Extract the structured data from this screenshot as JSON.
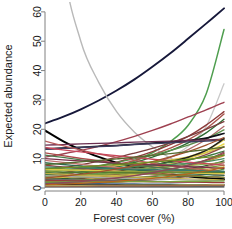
{
  "chart_data": {
    "type": "line",
    "title": "",
    "xlabel": "Forest cover (%)",
    "ylabel": "Expected abundance",
    "xlim": [
      0,
      100
    ],
    "ylim": [
      0,
      62
    ],
    "xticks": [
      0,
      20,
      40,
      60,
      80,
      100
    ],
    "yticks": [
      0,
      10,
      20,
      30,
      40,
      50,
      60
    ],
    "grid": false,
    "legend": "none",
    "x": [
      0,
      10,
      20,
      30,
      40,
      50,
      60,
      70,
      80,
      90,
      100
    ],
    "series": [
      {
        "name": "sp01",
        "color": "#16183a",
        "width": 1.9,
        "values": [
          22.0,
          24.2,
          26.8,
          29.8,
          33.2,
          37.0,
          41.3,
          45.9,
          50.9,
          56.0,
          61.2
        ]
      },
      {
        "name": "sp02",
        "color": "#4f9e4f",
        "width": 1.5,
        "values": [
          2.6,
          3.3,
          4.3,
          5.5,
          7.1,
          9.2,
          12.0,
          15.8,
          21.4,
          32.0,
          54.0
        ]
      },
      {
        "name": "sp03",
        "color": "#b9b9b9",
        "width": 1.4,
        "values": [
          150.0,
          78.0,
          50.0,
          36.0,
          26.0,
          19.0,
          14.0,
          10.2,
          7.3,
          5.1,
          3.2
        ]
      },
      {
        "name": "sp04",
        "color": "#c9c9c9",
        "width": 1.3,
        "values": [
          2.3,
          2.8,
          3.4,
          4.2,
          5.2,
          6.5,
          8.2,
          10.6,
          14.2,
          21.0,
          35.5
        ]
      },
      {
        "name": "sp05",
        "color": "#000000",
        "width": 2.0,
        "values": [
          19.6,
          16.0,
          13.0,
          10.6,
          8.6,
          7.0,
          5.7,
          4.7,
          4.0,
          3.4,
          3.0
        ]
      },
      {
        "name": "sp06",
        "color": "#9e4050",
        "width": 1.4,
        "values": [
          10.5,
          11.6,
          12.8,
          14.2,
          15.8,
          17.6,
          19.6,
          21.8,
          24.2,
          26.6,
          29.2
        ]
      },
      {
        "name": "sp07",
        "color": "#8c3a3a",
        "width": 1.4,
        "values": [
          4.4,
          5.2,
          6.2,
          7.4,
          8.8,
          10.4,
          12.4,
          14.8,
          17.6,
          21.4,
          26.0
        ]
      },
      {
        "name": "sp08",
        "color": "#a8544c",
        "width": 1.4,
        "values": [
          3.9,
          4.6,
          5.5,
          6.6,
          7.9,
          9.4,
          11.3,
          13.6,
          16.4,
          20.2,
          25.2
        ]
      },
      {
        "name": "sp09",
        "color": "#2f6b34",
        "width": 1.4,
        "values": [
          3.2,
          4.0,
          4.9,
          6.0,
          7.2,
          8.7,
          10.5,
          12.7,
          15.4,
          18.8,
          23.4
        ]
      },
      {
        "name": "sp10",
        "color": "#7b3d3d",
        "width": 1.3,
        "values": [
          6.0,
          6.9,
          7.9,
          9.1,
          10.4,
          11.9,
          13.5,
          15.4,
          17.6,
          20.0,
          22.6
        ]
      },
      {
        "name": "sp11",
        "color": "#b06a6a",
        "width": 1.3,
        "values": [
          1.9,
          2.5,
          3.2,
          4.1,
          5.2,
          6.6,
          8.3,
          10.4,
          13.1,
          16.5,
          21.0
        ]
      },
      {
        "name": "sp12",
        "color": "#5b8f4a",
        "width": 1.3,
        "values": [
          5.2,
          5.9,
          6.7,
          7.6,
          8.7,
          9.9,
          11.2,
          12.8,
          14.6,
          16.8,
          19.8
        ]
      },
      {
        "name": "sp13",
        "color": "#101018",
        "width": 1.6,
        "values": [
          13.3,
          13.6,
          13.9,
          14.2,
          14.5,
          14.9,
          15.3,
          15.7,
          16.2,
          17.0,
          18.6
        ]
      },
      {
        "name": "sp14",
        "color": "#3d3d5e",
        "width": 1.4,
        "values": [
          13.2,
          13.5,
          13.8,
          14.1,
          14.4,
          14.8,
          15.1,
          15.4,
          15.7,
          16.0,
          16.3
        ]
      },
      {
        "name": "sp15",
        "color": "#6b2f50",
        "width": 1.3,
        "values": [
          14.6,
          14.8,
          15.0,
          15.2,
          15.4,
          15.6,
          15.8,
          16.0,
          16.2,
          16.4,
          16.6
        ]
      },
      {
        "name": "sp16",
        "color": "#e3d25a",
        "width": 1.5,
        "values": [
          2.8,
          3.3,
          3.9,
          4.6,
          5.4,
          6.4,
          7.6,
          9.0,
          10.6,
          12.8,
          16.4
        ]
      },
      {
        "name": "sp17",
        "color": "#e8d84e",
        "width": 1.5,
        "values": [
          2.1,
          2.6,
          3.1,
          3.8,
          4.6,
          5.6,
          6.8,
          8.2,
          10.0,
          12.2,
          15.0
        ]
      },
      {
        "name": "sp18",
        "color": "#d4c04a",
        "width": 1.3,
        "values": [
          5.6,
          6.0,
          6.5,
          7.0,
          7.6,
          8.2,
          8.9,
          9.6,
          10.6,
          12.0,
          14.2
        ]
      },
      {
        "name": "sp19",
        "color": "#1e1e1e",
        "width": 1.5,
        "values": [
          3.1,
          3.6,
          4.2,
          4.9,
          5.7,
          6.6,
          7.7,
          9.0,
          10.5,
          12.8,
          16.8
        ]
      },
      {
        "name": "sp20",
        "color": "#8e4a42",
        "width": 1.3,
        "values": [
          2.2,
          2.7,
          3.2,
          3.9,
          4.6,
          5.5,
          6.6,
          7.9,
          9.4,
          11.4,
          14.0
        ]
      },
      {
        "name": "sp21",
        "color": "#3f7a3f",
        "width": 1.3,
        "values": [
          4.6,
          5.0,
          5.5,
          6.0,
          6.6,
          7.2,
          7.9,
          8.7,
          9.6,
          10.8,
          12.6
        ]
      },
      {
        "name": "sp22",
        "color": "#6f9e52",
        "width": 1.3,
        "values": [
          3.6,
          4.0,
          4.4,
          4.9,
          5.4,
          6.0,
          6.7,
          7.4,
          8.3,
          9.4,
          11.4
        ]
      },
      {
        "name": "sp23",
        "color": "#a04848",
        "width": 1.3,
        "values": [
          1.5,
          1.9,
          2.3,
          2.9,
          3.5,
          4.3,
          5.2,
          6.4,
          7.8,
          9.4,
          11.8
        ]
      },
      {
        "name": "sp24",
        "color": "#c08a3a",
        "width": 1.3,
        "values": [
          2.0,
          2.4,
          2.8,
          3.3,
          3.9,
          4.6,
          5.4,
          6.4,
          7.5,
          9.0,
          11.0
        ]
      },
      {
        "name": "sp25",
        "color": "#4a8c5e",
        "width": 1.3,
        "values": [
          6.2,
          6.4,
          6.6,
          6.8,
          7.0,
          7.3,
          7.6,
          8.0,
          8.4,
          9.0,
          10.0
        ]
      },
      {
        "name": "sp26",
        "color": "#2e5e2e",
        "width": 1.3,
        "values": [
          2.9,
          3.2,
          3.5,
          3.9,
          4.3,
          4.8,
          5.3,
          5.9,
          6.6,
          7.6,
          9.2
        ]
      },
      {
        "name": "sp27",
        "color": "#8aa84a",
        "width": 1.3,
        "values": [
          5.8,
          5.9,
          6.0,
          6.2,
          6.4,
          6.6,
          6.9,
          7.2,
          7.6,
          8.1,
          8.8
        ]
      },
      {
        "name": "sp28",
        "color": "#b4726a",
        "width": 1.3,
        "values": [
          1.2,
          1.5,
          1.9,
          2.3,
          2.8,
          3.4,
          4.1,
          5.0,
          6.0,
          7.2,
          8.6
        ]
      },
      {
        "name": "sp29",
        "color": "#7a9c3a",
        "width": 1.3,
        "values": [
          4.0,
          4.2,
          4.4,
          4.6,
          4.9,
          5.2,
          5.5,
          5.9,
          6.3,
          6.9,
          7.8
        ]
      },
      {
        "name": "sp30",
        "color": "#d0b84a",
        "width": 1.3,
        "values": [
          3.4,
          3.6,
          3.8,
          4.0,
          4.3,
          4.6,
          4.9,
          5.3,
          5.7,
          6.3,
          7.2
        ]
      },
      {
        "name": "sp31",
        "color": "#5e8c3e",
        "width": 1.2,
        "values": [
          2.4,
          2.6,
          2.8,
          3.0,
          3.3,
          3.6,
          3.9,
          4.3,
          4.7,
          5.3,
          6.4
        ]
      },
      {
        "name": "sp32",
        "color": "#3a6e4a",
        "width": 1.2,
        "values": [
          1.8,
          2.0,
          2.2,
          2.4,
          2.7,
          3.0,
          3.3,
          3.7,
          4.1,
          4.7,
          5.6
        ]
      },
      {
        "name": "sp33",
        "color": "#8c5a3a",
        "width": 1.2,
        "values": [
          1.0,
          1.2,
          1.4,
          1.7,
          2.0,
          2.4,
          2.8,
          3.3,
          3.9,
          4.6,
          5.4
        ]
      },
      {
        "name": "sp34",
        "color": "#aa4a4a",
        "width": 1.3,
        "values": [
          12.0,
          11.0,
          10.1,
          9.3,
          8.5,
          7.8,
          7.2,
          6.6,
          6.0,
          5.6,
          5.1
        ]
      },
      {
        "name": "sp35",
        "color": "#b85c5c",
        "width": 1.3,
        "values": [
          16.0,
          14.4,
          12.9,
          11.6,
          10.4,
          9.4,
          8.4,
          7.6,
          6.8,
          6.1,
          5.5
        ]
      },
      {
        "name": "sp36",
        "color": "#c07070",
        "width": 1.3,
        "values": [
          9.4,
          8.7,
          8.1,
          7.5,
          7.0,
          6.5,
          6.0,
          5.6,
          5.2,
          4.8,
          4.4
        ]
      },
      {
        "name": "sp37",
        "color": "#9e3a3a",
        "width": 1.3,
        "values": [
          7.8,
          7.2,
          6.7,
          6.2,
          5.7,
          5.3,
          4.9,
          4.5,
          4.2,
          3.9,
          3.6
        ]
      },
      {
        "name": "sp38",
        "color": "#4a7a4a",
        "width": 1.3,
        "values": [
          11.2,
          10.4,
          9.6,
          8.9,
          8.3,
          7.7,
          7.1,
          6.6,
          6.1,
          5.7,
          5.2
        ]
      },
      {
        "name": "sp39",
        "color": "#2f6b4f",
        "width": 1.3,
        "values": [
          8.6,
          8.0,
          7.5,
          7.0,
          6.5,
          6.1,
          5.7,
          5.3,
          4.9,
          4.6,
          4.3
        ]
      },
      {
        "name": "sp40",
        "color": "#7a8c3a",
        "width": 1.3,
        "values": [
          6.8,
          6.4,
          6.0,
          5.6,
          5.3,
          5.0,
          4.7,
          4.4,
          4.1,
          3.9,
          3.6
        ]
      },
      {
        "name": "sp41",
        "color": "#c4b04a",
        "width": 1.3,
        "values": [
          5.0,
          4.7,
          4.4,
          4.2,
          3.9,
          3.7,
          3.5,
          3.3,
          3.1,
          2.9,
          2.7
        ]
      },
      {
        "name": "sp42",
        "color": "#a8a8a8",
        "width": 1.2,
        "values": [
          4.2,
          4.0,
          3.8,
          3.6,
          3.4,
          3.2,
          3.1,
          2.9,
          2.8,
          2.6,
          2.5
        ]
      },
      {
        "name": "sp43",
        "color": "#6a6a6a",
        "width": 1.2,
        "values": [
          3.0,
          2.9,
          2.7,
          2.6,
          2.5,
          2.4,
          2.3,
          2.2,
          2.1,
          2.0,
          1.9
        ]
      },
      {
        "name": "sp44",
        "color": "#963c3c",
        "width": 1.2,
        "values": [
          2.6,
          2.5,
          2.4,
          2.3,
          2.2,
          2.2,
          2.1,
          2.0,
          2.0,
          1.9,
          1.8
        ]
      },
      {
        "name": "sp45",
        "color": "#3a5e8c",
        "width": 1.2,
        "values": [
          1.6,
          1.6,
          1.5,
          1.5,
          1.4,
          1.4,
          1.3,
          1.3,
          1.2,
          1.2,
          1.1
        ]
      },
      {
        "name": "sp46",
        "color": "#d8c84a",
        "width": 1.4,
        "values": [
          6.4,
          6.2,
          6.0,
          5.9,
          5.7,
          5.6,
          5.4,
          5.3,
          5.2,
          5.0,
          4.9
        ]
      },
      {
        "name": "sp47",
        "color": "#4c7a2e",
        "width": 1.4,
        "values": [
          5.4,
          5.4,
          5.4,
          5.4,
          5.4,
          5.4,
          5.4,
          5.4,
          5.4,
          5.4,
          5.4
        ]
      },
      {
        "name": "sp48",
        "color": "#000000",
        "width": 1.4,
        "values": [
          1.0,
          1.0,
          1.0,
          1.0,
          1.0,
          1.0,
          1.0,
          1.0,
          1.0,
          1.0,
          1.0
        ]
      },
      {
        "name": "sp49",
        "color": "#2b2b2b",
        "width": 1.3,
        "values": [
          0.4,
          0.4,
          0.4,
          0.4,
          0.4,
          0.4,
          0.4,
          0.4,
          0.4,
          0.4,
          0.4
        ]
      },
      {
        "name": "sp50",
        "color": "#7aa03a",
        "width": 1.3,
        "values": [
          2.0,
          2.0,
          2.1,
          2.1,
          2.1,
          2.2,
          2.2,
          2.2,
          2.3,
          2.3,
          2.4
        ]
      },
      {
        "name": "sp51",
        "color": "#b4b46a",
        "width": 1.2,
        "values": [
          0.8,
          0.8,
          0.9,
          0.9,
          0.9,
          1.0,
          1.0,
          1.0,
          1.1,
          1.1,
          1.2
        ]
      },
      {
        "name": "sp52",
        "color": "#9e6a4a",
        "width": 1.2,
        "values": [
          0.6,
          0.6,
          0.6,
          0.7,
          0.7,
          0.7,
          0.8,
          0.8,
          0.8,
          0.9,
          0.9
        ]
      },
      {
        "name": "sp53",
        "color": "#c8465a",
        "width": 1.3,
        "values": [
          13.8,
          13.0,
          12.3,
          11.6,
          11.0,
          10.4,
          9.8,
          9.3,
          8.8,
          8.3,
          7.8
        ]
      },
      {
        "name": "sp54",
        "color": "#7a2f4a",
        "width": 1.3,
        "values": [
          10.0,
          9.6,
          9.2,
          8.9,
          8.5,
          8.2,
          7.9,
          7.6,
          7.3,
          7.0,
          6.7
        ]
      },
      {
        "name": "sp55",
        "color": "#3a7a6a",
        "width": 1.3,
        "values": [
          7.2,
          7.0,
          6.9,
          6.7,
          6.6,
          6.4,
          6.3,
          6.1,
          6.0,
          5.8,
          5.7
        ]
      },
      {
        "name": "sp56",
        "color": "#a0522d",
        "width": 1.3,
        "values": [
          3.4,
          4.0,
          4.7,
          5.5,
          6.5,
          7.6,
          9.0,
          10.6,
          12.4,
          14.6,
          17.2
        ]
      },
      {
        "name": "sp57",
        "color": "#556b2f",
        "width": 1.3,
        "values": [
          8.0,
          8.4,
          8.9,
          9.4,
          9.9,
          10.5,
          11.1,
          11.7,
          12.4,
          13.1,
          13.9
        ]
      },
      {
        "name": "sp58",
        "color": "#8b4a5a",
        "width": 1.3,
        "values": [
          1.4,
          1.8,
          2.2,
          2.8,
          3.4,
          4.2,
          5.2,
          6.4,
          7.8,
          9.6,
          12.2
        ]
      },
      {
        "name": "sp59",
        "color": "#6b8e23",
        "width": 1.3,
        "values": [
          6.6,
          6.9,
          7.2,
          7.6,
          8.0,
          8.4,
          8.8,
          9.3,
          9.8,
          10.4,
          11.2
        ]
      },
      {
        "name": "sp60",
        "color": "#b5651d",
        "width": 1.2,
        "values": [
          1.1,
          1.3,
          1.6,
          1.9,
          2.3,
          2.8,
          3.3,
          4.0,
          4.8,
          5.8,
          7.0
        ]
      }
    ]
  },
  "axes": {
    "x_tick_labels": [
      "0",
      "20",
      "40",
      "60",
      "80",
      "100"
    ],
    "y_tick_labels": [
      "0",
      "10",
      "20",
      "30",
      "40",
      "50",
      "60"
    ],
    "x_title": "Forest cover (%)",
    "y_title": "Expected abundance"
  }
}
